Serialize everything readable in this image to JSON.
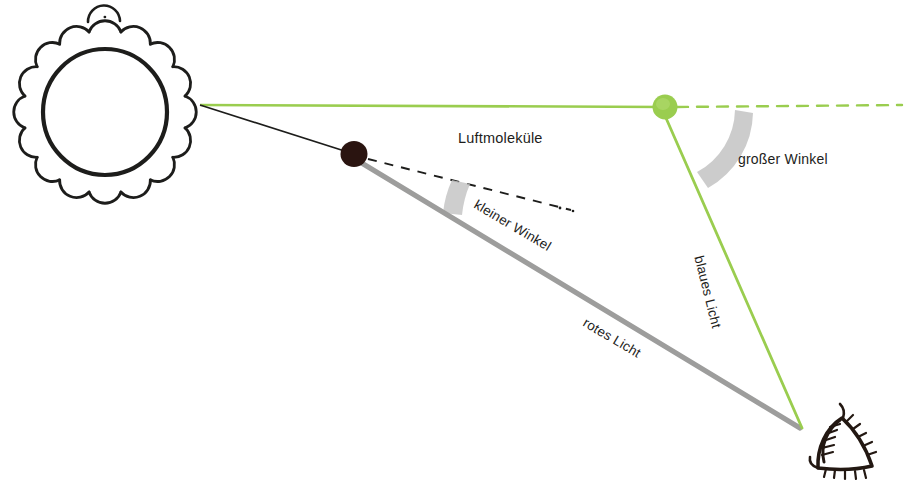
{
  "diagram": {
    "background_color": "#ffffff",
    "labels": {
      "luftmolekuele": "Luftmoleküle",
      "grosser_winkel": "großer Winkel",
      "kleiner_winkel": "kleiner Winkel",
      "rotes_licht": "rotes Licht",
      "blaues_licht": "blaues Licht"
    },
    "colors": {
      "green_ray": "#9ACD4F",
      "gray_ray": "#9d9d9c",
      "black_ray": "#1d1d1b",
      "dark_molecule": "#2a1410",
      "green_molecule": "#9ACD4F",
      "angle_arc": "#c6c6c6",
      "text": "#1d1d1b"
    },
    "objects": {
      "sun": {
        "name": "Sonne",
        "center_x": 105,
        "center_y": 112,
        "radius": 62,
        "ray_count": 16
      },
      "dark_molecule": {
        "name": "Luftmolekül (rote Streuung)",
        "center_x": 354,
        "center_y": 154,
        "radius": 13
      },
      "green_molecule": {
        "name": "Luftmolekül (blaue Streuung)",
        "center_x": 665,
        "center_y": 107,
        "radius": 12
      },
      "eye": {
        "name": "Auge des Beobachters",
        "center_x": 845,
        "center_y": 452
      }
    },
    "rays": {
      "sun_origin_x": 200,
      "sun_origin_y": 105,
      "green_incoming": "horizontal vom Sonnenrand zum grünen Molekül",
      "black_incoming": "vom Sonnenrand zum dunklen Molekül",
      "green_dashed_continuation": "gestrichelt weiter nach rechts",
      "black_dashed_continuation": "gestrichelt weiter nach rechts unten",
      "red_scattered": "graue Linie vom dunklen Molekül zum Auge",
      "blue_scattered": "grüne Linie vom grünen Molekül zum Auge",
      "observer_x": 800,
      "observer_y": 428
    },
    "angles": {
      "small_angle_deg": 12,
      "large_angle_deg": 73
    }
  }
}
